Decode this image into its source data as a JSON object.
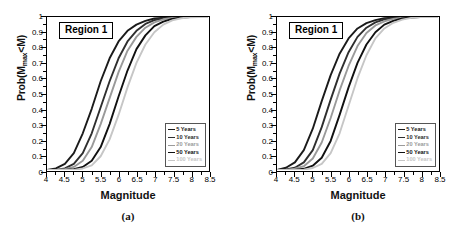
{
  "figure": {
    "panels": [
      {
        "letter": "(a)",
        "region_label": "Region 1"
      },
      {
        "letter": "(b)",
        "region_label": "Region 1"
      }
    ]
  },
  "chart_data": [
    {
      "type": "line",
      "title": "Region 1",
      "panel": "(a)",
      "xlabel": "Magnitude",
      "ylabel": "Prob(Mmax<M)",
      "xlim": [
        4,
        8.5
      ],
      "ylim": [
        0,
        1
      ],
      "xticks": [
        "4",
        "4.5",
        "5",
        "5.5",
        "6",
        "6.5",
        "7",
        "7.5",
        "8",
        "8.5"
      ],
      "yticks": [
        "0",
        "0.1",
        "0.2",
        "0.3",
        "0.4",
        "0.5",
        "0.6",
        "0.7",
        "0.8",
        "0.9",
        "1"
      ],
      "grid": false,
      "legend_position": "lower-right",
      "x": [
        4,
        4.25,
        4.5,
        4.75,
        5,
        5.25,
        5.5,
        5.75,
        6,
        6.25,
        6.5,
        6.75,
        7,
        7.25,
        7.5,
        7.75,
        8,
        8.25,
        8.5
      ],
      "series": [
        {
          "name": "5 Years",
          "color": "#1a1a1a",
          "values": [
            0.0,
            0.01,
            0.04,
            0.11,
            0.24,
            0.4,
            0.58,
            0.73,
            0.84,
            0.91,
            0.95,
            0.975,
            0.99,
            0.995,
            0.998,
            0.999,
            1.0,
            1.0,
            1.0
          ]
        },
        {
          "name": "10 Years",
          "color": "#2e2e2e",
          "values": [
            0.0,
            0.0,
            0.01,
            0.04,
            0.11,
            0.24,
            0.41,
            0.58,
            0.73,
            0.84,
            0.91,
            0.955,
            0.98,
            0.99,
            0.996,
            0.999,
            1.0,
            1.0,
            1.0
          ]
        },
        {
          "name": "20 Years",
          "color": "#9a9a9a",
          "values": [
            0.0,
            0.0,
            0.005,
            0.02,
            0.06,
            0.15,
            0.3,
            0.47,
            0.64,
            0.78,
            0.87,
            0.93,
            0.965,
            0.985,
            0.994,
            0.998,
            1.0,
            1.0,
            1.0
          ]
        },
        {
          "name": "50 Years",
          "color": "#111111",
          "values": [
            0.0,
            0.0,
            0.0,
            0.005,
            0.02,
            0.06,
            0.15,
            0.3,
            0.48,
            0.65,
            0.79,
            0.88,
            0.94,
            0.97,
            0.988,
            0.996,
            0.999,
            1.0,
            1.0
          ]
        },
        {
          "name": "100 Years",
          "color": "#c6c6c6",
          "values": [
            0.0,
            0.0,
            0.0,
            0.0,
            0.01,
            0.03,
            0.09,
            0.2,
            0.36,
            0.54,
            0.7,
            0.82,
            0.9,
            0.95,
            0.978,
            0.992,
            0.998,
            1.0,
            1.0
          ]
        }
      ]
    },
    {
      "type": "line",
      "title": "Region 1",
      "panel": "(b)",
      "xlabel": "Magnitude",
      "ylabel": "Prob(Mmax<M)",
      "xlim": [
        4,
        8.5
      ],
      "ylim": [
        0,
        1
      ],
      "xticks": [
        "4",
        "4.5",
        "5",
        "5.5",
        "6",
        "6.5",
        "7",
        "7.5",
        "8",
        "8.5"
      ],
      "yticks": [
        "0",
        "0.1",
        "0.2",
        "0.3",
        "0.4",
        "0.5",
        "0.6",
        "0.7",
        "0.8",
        "0.9",
        "1"
      ],
      "grid": false,
      "legend_position": "lower-right",
      "x": [
        4,
        4.25,
        4.5,
        4.75,
        5,
        5.25,
        5.5,
        5.75,
        6,
        6.25,
        6.5,
        6.75,
        7,
        7.25,
        7.5,
        7.75,
        8,
        8.25,
        8.5
      ],
      "series": [
        {
          "name": "5 Years",
          "color": "#1a1a1a",
          "values": [
            0.0,
            0.015,
            0.05,
            0.13,
            0.27,
            0.45,
            0.62,
            0.76,
            0.86,
            0.925,
            0.96,
            0.98,
            0.992,
            0.996,
            0.999,
            1.0,
            1.0,
            1.0,
            1.0
          ]
        },
        {
          "name": "10 Years",
          "color": "#2e2e2e",
          "values": [
            0.0,
            0.003,
            0.015,
            0.05,
            0.13,
            0.28,
            0.46,
            0.63,
            0.77,
            0.87,
            0.93,
            0.965,
            0.985,
            0.993,
            0.997,
            0.999,
            1.0,
            1.0,
            1.0
          ]
        },
        {
          "name": "20 Years",
          "color": "#9a9a9a",
          "values": [
            0.0,
            0.0,
            0.008,
            0.025,
            0.075,
            0.18,
            0.34,
            0.52,
            0.68,
            0.81,
            0.895,
            0.945,
            0.972,
            0.988,
            0.995,
            0.999,
            1.0,
            1.0,
            1.0
          ]
        },
        {
          "name": "50 Years",
          "color": "#111111",
          "values": [
            0.0,
            0.0,
            0.0,
            0.008,
            0.028,
            0.08,
            0.19,
            0.36,
            0.54,
            0.7,
            0.82,
            0.9,
            0.95,
            0.975,
            0.99,
            0.997,
            0.999,
            1.0,
            1.0
          ]
        },
        {
          "name": "100 Years",
          "color": "#c6c6c6",
          "values": [
            0.0,
            0.0,
            0.0,
            0.002,
            0.013,
            0.04,
            0.11,
            0.24,
            0.42,
            0.6,
            0.75,
            0.86,
            0.925,
            0.962,
            0.983,
            0.994,
            0.999,
            1.0,
            1.0
          ]
        }
      ]
    }
  ]
}
